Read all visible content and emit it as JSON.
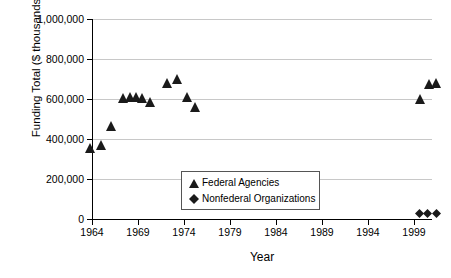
{
  "chart_data": {
    "type": "scatter",
    "title": "",
    "xlabel": "Year",
    "ylabel": "Funding Total ($ thousands)",
    "xlim": [
      1963,
      2002
    ],
    "ylim": [
      0,
      1000000
    ],
    "xticks": [
      1964,
      1969,
      1974,
      1979,
      1984,
      1989,
      1994,
      1999
    ],
    "xtick_labels": [
      "1964",
      "1969",
      "1974",
      "1979",
      "1984",
      "1989",
      "1994",
      "1999"
    ],
    "yticks": [
      0,
      200000,
      400000,
      600000,
      800000,
      1000000
    ],
    "ytick_labels": [
      "0",
      "200,000",
      "400,000",
      "600,000",
      "800,000",
      "1,000,000"
    ],
    "grid": "horizontal",
    "legend_position": "inside-center-lower",
    "series": [
      {
        "name": "Federal Agencies",
        "marker": "triangle",
        "color": "#1a1a1a",
        "points": [
          {
            "x": 1963.8,
            "y": 355000
          },
          {
            "x": 1965.0,
            "y": 370000
          },
          {
            "x": 1966.1,
            "y": 465000
          },
          {
            "x": 1967.4,
            "y": 605000
          },
          {
            "x": 1968.1,
            "y": 610000
          },
          {
            "x": 1968.8,
            "y": 610000
          },
          {
            "x": 1969.4,
            "y": 605000
          },
          {
            "x": 1970.3,
            "y": 585000
          },
          {
            "x": 1972.2,
            "y": 680000
          },
          {
            "x": 1973.2,
            "y": 700000
          },
          {
            "x": 1974.3,
            "y": 610000
          },
          {
            "x": 1975.2,
            "y": 560000
          },
          {
            "x": 1999.6,
            "y": 600000
          },
          {
            "x": 2000.6,
            "y": 675000
          },
          {
            "x": 2001.4,
            "y": 680000
          }
        ]
      },
      {
        "name": "Nonfederal Organizations",
        "marker": "diamond",
        "color": "#1a1a1a",
        "points": [
          {
            "x": 1999.6,
            "y": 28000
          },
          {
            "x": 2000.5,
            "y": 28000
          },
          {
            "x": 2001.4,
            "y": 30000
          }
        ]
      }
    ]
  },
  "legend": {
    "entries": [
      {
        "label": "Federal Agencies",
        "marker": "triangle"
      },
      {
        "label": "Nonfederal Organizations",
        "marker": "diamond"
      }
    ]
  }
}
